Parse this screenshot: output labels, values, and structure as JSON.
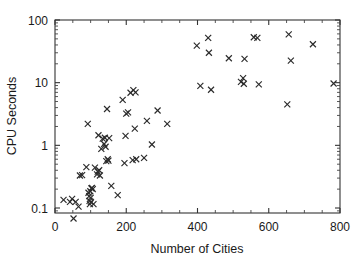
{
  "figure": {
    "background_color": "#ffffff",
    "marker_color": "#2b2b2b",
    "axis_color": "#333333",
    "marker_symbol": "x"
  },
  "chart_data": {
    "type": "scatter",
    "title": "",
    "xlabel": "Number of Cities",
    "ylabel": "CPU Seconds",
    "xscale": "linear",
    "yscale": "log",
    "xlim": [
      0,
      800
    ],
    "ylim": [
      0.07,
      100
    ],
    "grid": false,
    "legend": null,
    "xticks": [
      0,
      200,
      400,
      600,
      800
    ],
    "xtick_labels": [
      "0",
      "200",
      "400",
      "600",
      "800"
    ],
    "yticks": [
      0.1,
      1,
      10,
      100
    ],
    "ytick_labels": [
      "0.1",
      "1",
      "10",
      "100"
    ],
    "minor_ticks": true,
    "series": [
      {
        "name": "TSP instances",
        "marker": "x",
        "points": [
          [
            24,
            0.135
          ],
          [
            42,
            0.125
          ],
          [
            48,
            0.14
          ],
          [
            52,
            0.068
          ],
          [
            58,
            0.125
          ],
          [
            66,
            0.105
          ],
          [
            70,
            0.33
          ],
          [
            76,
            0.335
          ],
          [
            88,
            0.45
          ],
          [
            92,
            2.2
          ],
          [
            94,
            0.175
          ],
          [
            96,
            0.155
          ],
          [
            97,
            0.13
          ],
          [
            98,
            0.115
          ],
          [
            99,
            0.185
          ],
          [
            100,
            0.145
          ],
          [
            101,
            0.125
          ],
          [
            102,
            0.205
          ],
          [
            104,
            0.21
          ],
          [
            106,
            0.2
          ],
          [
            108,
            0.115
          ],
          [
            112,
            0.44
          ],
          [
            118,
            0.345
          ],
          [
            120,
            0.38
          ],
          [
            122,
            1.45
          ],
          [
            124,
            0.4
          ],
          [
            126,
            0.33
          ],
          [
            130,
            0.88
          ],
          [
            134,
            1.28
          ],
          [
            138,
            1.05
          ],
          [
            140,
            1.32
          ],
          [
            142,
            0.95
          ],
          [
            144,
            0.56
          ],
          [
            146,
            3.8
          ],
          [
            148,
            0.6
          ],
          [
            150,
            0.57
          ],
          [
            152,
            1.3
          ],
          [
            158,
            0.225
          ],
          [
            176,
            0.16
          ],
          [
            190,
            5.3
          ],
          [
            195,
            0.52
          ],
          [
            198,
            1.42
          ],
          [
            200,
            3.2
          ],
          [
            205,
            3.35
          ],
          [
            212,
            6.9
          ],
          [
            218,
            0.58
          ],
          [
            220,
            7.6
          ],
          [
            224,
            1.85
          ],
          [
            226,
            7.0
          ],
          [
            228,
            0.6
          ],
          [
            250,
            0.63
          ],
          [
            258,
            2.45
          ],
          [
            272,
            1.03
          ],
          [
            288,
            3.6
          ],
          [
            315,
            2.2
          ],
          [
            398,
            39.0
          ],
          [
            408,
            8.9
          ],
          [
            430,
            52.0
          ],
          [
            432,
            30.0
          ],
          [
            438,
            7.7
          ],
          [
            488,
            24.5
          ],
          [
            522,
            10.3
          ],
          [
            528,
            11.8
          ],
          [
            530,
            9.6
          ],
          [
            532,
            24.0
          ],
          [
            558,
            53.0
          ],
          [
            568,
            52.0
          ],
          [
            572,
            9.4
          ],
          [
            652,
            4.5
          ],
          [
            656,
            59.0
          ],
          [
            662,
            22.5
          ],
          [
            724,
            41.0
          ],
          [
            782,
            9.7
          ]
        ]
      }
    ]
  }
}
